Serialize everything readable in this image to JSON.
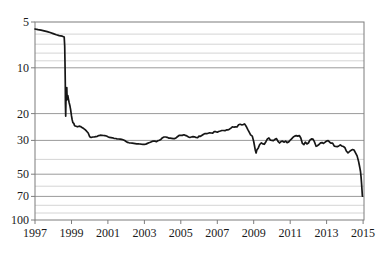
{
  "style": {
    "background": "#ffffff",
    "plot_border_color": "#7d7d7d",
    "major_grid_color": "#9a9a9a",
    "minor_grid_color": "#c9c9c9",
    "label_color": "#1a1a1a",
    "line_color": "#161616"
  },
  "chart_data": {
    "type": "line",
    "title": "",
    "xlabel": "",
    "ylabel": "",
    "legend": "none",
    "grid": "horizontal-only",
    "x_range": [
      1997,
      2015.05
    ],
    "x_tick_values": [
      1997,
      1999,
      2001,
      2003,
      2005,
      2007,
      2009,
      2011,
      2013,
      2015
    ],
    "x_tick_labels": [
      "1997",
      "1999",
      "2001",
      "2003",
      "2005",
      "2007",
      "2009",
      "2011",
      "2013",
      "2015"
    ],
    "y_axis": {
      "scale": "log",
      "direction": "inverted (values increase downward)",
      "range": [
        5,
        100
      ],
      "tick_values": [
        5,
        10,
        20,
        30,
        50,
        70,
        100
      ],
      "tick_labels": [
        "5",
        "10",
        "20",
        "30",
        "50",
        "70",
        "100"
      ],
      "gridline_values": [
        6,
        7,
        8,
        9,
        10,
        20,
        30,
        40,
        50,
        60,
        70,
        80,
        90
      ]
    },
    "series": [
      {
        "name": "series-1",
        "color": "#161616",
        "points": [
          [
            1997.0,
            5.56
          ],
          [
            1997.17,
            5.62
          ],
          [
            1997.33,
            5.66
          ],
          [
            1997.5,
            5.72
          ],
          [
            1997.67,
            5.78
          ],
          [
            1997.83,
            5.86
          ],
          [
            1998.0,
            5.96
          ],
          [
            1998.17,
            6.07
          ],
          [
            1998.33,
            6.14
          ],
          [
            1998.5,
            6.2
          ],
          [
            1998.6,
            6.27
          ],
          [
            1998.63,
            7.2
          ],
          [
            1998.645,
            9.3
          ],
          [
            1998.66,
            12.8
          ],
          [
            1998.67,
            17.0
          ],
          [
            1998.685,
            20.8
          ],
          [
            1998.7,
            15.8
          ],
          [
            1998.715,
            14.6
          ],
          [
            1998.73,
            16.4
          ],
          [
            1998.745,
            13.5
          ],
          [
            1998.76,
            15.9
          ],
          [
            1998.78,
            16.1
          ],
          [
            1998.8,
            15.2
          ],
          [
            1998.83,
            16.0
          ],
          [
            1998.87,
            16.9
          ],
          [
            1998.91,
            17.6
          ],
          [
            1998.95,
            18.6
          ],
          [
            1999.0,
            20.7
          ],
          [
            1999.04,
            22.0
          ],
          [
            1999.08,
            22.9
          ],
          [
            1999.13,
            23.2
          ],
          [
            1999.17,
            24.0
          ],
          [
            1999.25,
            24.2
          ],
          [
            1999.33,
            24.4
          ],
          [
            1999.42,
            24.2
          ],
          [
            1999.5,
            24.3
          ],
          [
            1999.58,
            24.7
          ],
          [
            1999.67,
            25.1
          ],
          [
            1999.75,
            25.5
          ],
          [
            1999.83,
            26.1
          ],
          [
            1999.92,
            26.8
          ],
          [
            2000.0,
            28.4
          ],
          [
            2000.08,
            28.7
          ],
          [
            2000.17,
            28.5
          ],
          [
            2000.25,
            28.5
          ],
          [
            2000.33,
            28.3
          ],
          [
            2000.42,
            28.2
          ],
          [
            2000.5,
            27.9
          ],
          [
            2000.58,
            27.7
          ],
          [
            2000.67,
            27.75
          ],
          [
            2000.75,
            27.85
          ],
          [
            2000.83,
            27.9
          ],
          [
            2000.92,
            28.05
          ],
          [
            2001.0,
            28.35
          ],
          [
            2001.08,
            28.65
          ],
          [
            2001.17,
            28.75
          ],
          [
            2001.25,
            28.85
          ],
          [
            2001.33,
            29.05
          ],
          [
            2001.42,
            29.15
          ],
          [
            2001.5,
            29.25
          ],
          [
            2001.58,
            29.35
          ],
          [
            2001.67,
            29.45
          ],
          [
            2001.75,
            29.55
          ],
          [
            2001.83,
            29.7
          ],
          [
            2001.92,
            30.05
          ],
          [
            2002.0,
            30.5
          ],
          [
            2002.08,
            30.9
          ],
          [
            2002.17,
            31.1
          ],
          [
            2002.25,
            31.2
          ],
          [
            2002.33,
            31.3
          ],
          [
            2002.42,
            31.4
          ],
          [
            2002.5,
            31.5
          ],
          [
            2002.58,
            31.55
          ],
          [
            2002.67,
            31.6
          ],
          [
            2002.75,
            31.65
          ],
          [
            2002.83,
            31.75
          ],
          [
            2002.92,
            31.8
          ],
          [
            2003.0,
            31.82
          ],
          [
            2003.08,
            31.7
          ],
          [
            2003.17,
            31.4
          ],
          [
            2003.25,
            31.1
          ],
          [
            2003.33,
            30.8
          ],
          [
            2003.42,
            30.45
          ],
          [
            2003.5,
            30.35
          ],
          [
            2003.58,
            30.3
          ],
          [
            2003.67,
            30.6
          ],
          [
            2003.75,
            30.1
          ],
          [
            2003.83,
            29.9
          ],
          [
            2003.92,
            29.45
          ],
          [
            2004.0,
            28.8
          ],
          [
            2004.08,
            28.5
          ],
          [
            2004.17,
            28.5
          ],
          [
            2004.25,
            28.6
          ],
          [
            2004.33,
            28.95
          ],
          [
            2004.42,
            29.0
          ],
          [
            2004.5,
            29.1
          ],
          [
            2004.58,
            29.2
          ],
          [
            2004.67,
            29.2
          ],
          [
            2004.75,
            28.8
          ],
          [
            2004.83,
            28.25
          ],
          [
            2004.92,
            27.75
          ],
          [
            2005.0,
            27.8
          ],
          [
            2005.08,
            27.8
          ],
          [
            2005.17,
            27.55
          ],
          [
            2005.25,
            27.8
          ],
          [
            2005.33,
            28.0
          ],
          [
            2005.42,
            28.5
          ],
          [
            2005.5,
            28.7
          ],
          [
            2005.58,
            28.5
          ],
          [
            2005.67,
            28.3
          ],
          [
            2005.75,
            28.4
          ],
          [
            2005.83,
            28.7
          ],
          [
            2005.92,
            28.8
          ],
          [
            2006.0,
            28.1
          ],
          [
            2006.08,
            28.2
          ],
          [
            2006.17,
            27.7
          ],
          [
            2006.25,
            27.3
          ],
          [
            2006.33,
            27.0
          ],
          [
            2006.42,
            27.1
          ],
          [
            2006.5,
            26.9
          ],
          [
            2006.58,
            26.75
          ],
          [
            2006.67,
            26.8
          ],
          [
            2006.75,
            26.9
          ],
          [
            2006.83,
            26.3
          ],
          [
            2006.92,
            26.3
          ],
          [
            2007.0,
            26.5
          ],
          [
            2007.08,
            26.2
          ],
          [
            2007.17,
            26.0
          ],
          [
            2007.25,
            25.8
          ],
          [
            2007.33,
            25.8
          ],
          [
            2007.42,
            25.9
          ],
          [
            2007.5,
            25.6
          ],
          [
            2007.58,
            25.6
          ],
          [
            2007.67,
            25.3
          ],
          [
            2007.75,
            24.9
          ],
          [
            2007.83,
            24.4
          ],
          [
            2007.92,
            24.55
          ],
          [
            2008.0,
            24.45
          ],
          [
            2008.08,
            24.5
          ],
          [
            2008.17,
            23.7
          ],
          [
            2008.25,
            23.5
          ],
          [
            2008.33,
            23.7
          ],
          [
            2008.42,
            23.6
          ],
          [
            2008.5,
            23.35
          ],
          [
            2008.58,
            24.2
          ],
          [
            2008.67,
            25.4
          ],
          [
            2008.75,
            26.5
          ],
          [
            2008.83,
            27.6
          ],
          [
            2008.92,
            28.1
          ],
          [
            2009.0,
            30.5
          ],
          [
            2009.08,
            34.5
          ],
          [
            2009.13,
            36.3
          ],
          [
            2009.17,
            34.7
          ],
          [
            2009.25,
            33.6
          ],
          [
            2009.33,
            31.9
          ],
          [
            2009.42,
            31.1
          ],
          [
            2009.5,
            31.6
          ],
          [
            2009.58,
            31.8
          ],
          [
            2009.67,
            30.6
          ],
          [
            2009.75,
            29.3
          ],
          [
            2009.83,
            28.9
          ],
          [
            2009.92,
            29.9
          ],
          [
            2010.0,
            29.95
          ],
          [
            2010.08,
            30.1
          ],
          [
            2010.17,
            29.5
          ],
          [
            2010.25,
            29.2
          ],
          [
            2010.33,
            30.4
          ],
          [
            2010.42,
            31.2
          ],
          [
            2010.5,
            30.5
          ],
          [
            2010.58,
            30.3
          ],
          [
            2010.67,
            30.8
          ],
          [
            2010.75,
            30.3
          ],
          [
            2010.83,
            31.0
          ],
          [
            2010.92,
            30.7
          ],
          [
            2011.0,
            29.9
          ],
          [
            2011.08,
            29.3
          ],
          [
            2011.17,
            28.5
          ],
          [
            2011.25,
            28.1
          ],
          [
            2011.33,
            27.9
          ],
          [
            2011.42,
            28.1
          ],
          [
            2011.5,
            27.85
          ],
          [
            2011.58,
            28.9
          ],
          [
            2011.67,
            31.4
          ],
          [
            2011.75,
            32.0
          ],
          [
            2011.83,
            30.8
          ],
          [
            2011.92,
            31.6
          ],
          [
            2012.0,
            31.2
          ],
          [
            2012.08,
            29.9
          ],
          [
            2012.17,
            29.3
          ],
          [
            2012.25,
            29.4
          ],
          [
            2012.33,
            30.6
          ],
          [
            2012.42,
            32.8
          ],
          [
            2012.5,
            32.5
          ],
          [
            2012.58,
            31.9
          ],
          [
            2012.67,
            31.1
          ],
          [
            2012.75,
            31.0
          ],
          [
            2012.83,
            31.4
          ],
          [
            2012.92,
            30.75
          ],
          [
            2013.0,
            30.25
          ],
          [
            2013.08,
            30.1
          ],
          [
            2013.17,
            30.8
          ],
          [
            2013.25,
            31.3
          ],
          [
            2013.33,
            31.25
          ],
          [
            2013.42,
            32.7
          ],
          [
            2013.5,
            32.9
          ],
          [
            2013.58,
            33.0
          ],
          [
            2013.67,
            32.6
          ],
          [
            2013.75,
            32.1
          ],
          [
            2013.83,
            32.65
          ],
          [
            2013.92,
            32.9
          ],
          [
            2014.0,
            33.5
          ],
          [
            2014.08,
            35.2
          ],
          [
            2014.17,
            36.2
          ],
          [
            2014.25,
            35.6
          ],
          [
            2014.33,
            34.9
          ],
          [
            2014.42,
            34.4
          ],
          [
            2014.5,
            34.7
          ],
          [
            2014.58,
            36.1
          ],
          [
            2014.67,
            37.9
          ],
          [
            2014.75,
            41.0
          ],
          [
            2014.79,
            43.5
          ],
          [
            2014.83,
            46.0
          ],
          [
            2014.86,
            48.0
          ],
          [
            2014.89,
            52.5
          ],
          [
            2014.92,
            58.0
          ],
          [
            2014.94,
            63.5
          ],
          [
            2014.96,
            69.8
          ]
        ]
      }
    ]
  }
}
